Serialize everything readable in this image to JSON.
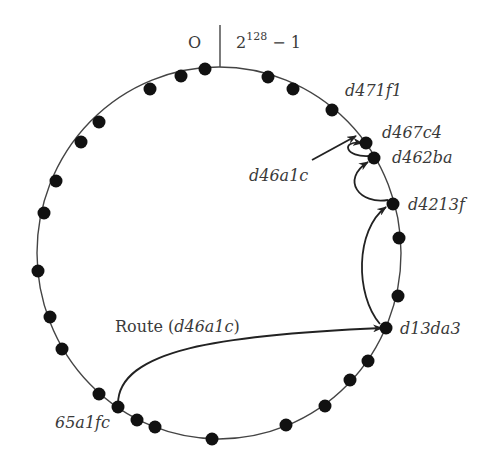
{
  "diagram": {
    "ring": {
      "cx": 219,
      "cy": 253,
      "rx": 182,
      "ry": 186
    },
    "origin_label": "O",
    "max_label_base": "2",
    "max_label_exp": "128",
    "max_label_suffix": " − 1",
    "labels": {
      "d471f1": "d471f1",
      "d467c4": "d467c4",
      "d462ba": "d462ba",
      "d46a1c": "d46a1c",
      "d4213f": "d4213f",
      "d13da3": "d13da3",
      "fc65a1": "65a1fc",
      "route_prefix": "Route (",
      "route_key": "d46a1c",
      "route_suffix": ")"
    },
    "nodes": [
      {
        "id": "n1",
        "x": 205,
        "y": 69
      },
      {
        "id": "n2",
        "x": 181,
        "y": 76
      },
      {
        "id": "n3",
        "x": 150,
        "y": 89
      },
      {
        "id": "n4",
        "x": 99,
        "y": 122
      },
      {
        "id": "n5",
        "x": 81,
        "y": 142
      },
      {
        "id": "n6",
        "x": 56,
        "y": 181
      },
      {
        "id": "n7",
        "x": 44,
        "y": 213
      },
      {
        "id": "n8",
        "x": 38,
        "y": 271
      },
      {
        "id": "n9",
        "x": 50,
        "y": 317
      },
      {
        "id": "n10",
        "x": 62,
        "y": 349
      },
      {
        "id": "n11",
        "x": 99,
        "y": 394
      },
      {
        "id": "65a1fc",
        "x": 118,
        "y": 407
      },
      {
        "id": "n13",
        "x": 137,
        "y": 420
      },
      {
        "id": "n14",
        "x": 155,
        "y": 427
      },
      {
        "id": "n15",
        "x": 212,
        "y": 439
      },
      {
        "id": "n16",
        "x": 286,
        "y": 425
      },
      {
        "id": "n17",
        "x": 325,
        "y": 406
      },
      {
        "id": "n18",
        "x": 350,
        "y": 380
      },
      {
        "id": "n19",
        "x": 368,
        "y": 361
      },
      {
        "id": "d13da3",
        "x": 386,
        "y": 328
      },
      {
        "id": "n21",
        "x": 398,
        "y": 296
      },
      {
        "id": "n22",
        "x": 399,
        "y": 238
      },
      {
        "id": "d4213f",
        "x": 393,
        "y": 204
      },
      {
        "id": "d462ba",
        "x": 374,
        "y": 158
      },
      {
        "id": "d467c4",
        "x": 366,
        "y": 143
      },
      {
        "id": "d471f1",
        "x": 332,
        "y": 110
      },
      {
        "id": "n27",
        "x": 293,
        "y": 89
      },
      {
        "id": "n28",
        "x": 268,
        "y": 77
      }
    ],
    "route_hops": [
      "65a1fc",
      "d13da3",
      "d4213f",
      "d462ba",
      "d467c4"
    ]
  }
}
